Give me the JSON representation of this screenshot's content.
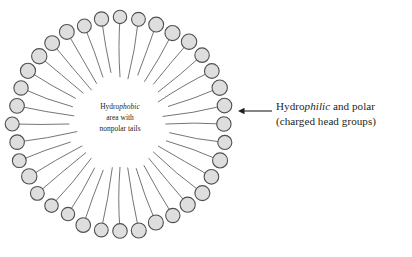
{
  "figure": {
    "background_color": "#ffffff"
  },
  "micelle": {
    "head_count": 36,
    "center_x": 120,
    "center_y": 124,
    "head_ring_radius": 106,
    "head_radius": 7.2,
    "tail_inner_radius": 48,
    "head_fill": "#dedede",
    "head_stroke": "#4f4f4f",
    "tail_stroke": "#5c5c5c"
  },
  "center_label": {
    "line1_prefix": "Hydro",
    "line1_italic": "phobic",
    "line2": "area with",
    "line3": "nonpolar tails"
  },
  "side_label": {
    "line1_prefix": "Hydro",
    "line1_italic": "philic",
    "line1_suffix": " and polar",
    "line2": "(charged head groups)"
  },
  "annotation": {
    "arrow_direction": "left",
    "arrow_color": "#231f20",
    "leader_x_start": 272,
    "leader_x_end": 238,
    "leader_y": 111
  }
}
